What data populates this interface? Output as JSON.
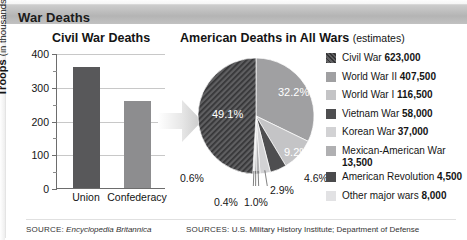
{
  "header": {
    "title": "War Deaths"
  },
  "bar_chart": {
    "title": "Civil War Deaths",
    "axis_label_main": "Troops",
    "axis_label_sub": "(in thousands)",
    "source_lead": "SOURCE:",
    "source_text": "Encyclopedia Britannica"
  },
  "pie_chart": {
    "title": "American Deaths in All Wars",
    "title_note": "(estimates)",
    "source_lead": "SOURCES:",
    "source_text": "U.S. Military History Institute; Department of Defense"
  },
  "chart_data": [
    {
      "type": "bar",
      "title": "Civil War Deaths",
      "categories": [
        "Union",
        "Confederacy"
      ],
      "values": [
        360,
        258
      ],
      "colors": [
        "#58585a",
        "#8d8d8f"
      ],
      "xlabel": "",
      "ylabel": "Troops (in thousands)",
      "ylim": [
        0,
        400
      ],
      "yticks": [
        0,
        100,
        200,
        300,
        400
      ],
      "ytick_labels": [
        "0",
        "100",
        "200",
        "300",
        "400"
      ],
      "grid": true
    },
    {
      "type": "pie",
      "title": "American Deaths in All Wars (estimates)",
      "labels": [
        "Civil War",
        "World War II",
        "World War I",
        "Vietnam War",
        "Korean War",
        "Mexican-American War",
        "American Revolution",
        "Other major wars"
      ],
      "values": [
        623000,
        407500,
        116500,
        58000,
        37000,
        13500,
        4500,
        8000
      ],
      "value_labels": [
        "623,000",
        "407,500",
        "116,500",
        "58,000",
        "37,000",
        "13,500",
        "4,500",
        "8,000"
      ],
      "percents": [
        "49.1%",
        "32.2%",
        "9.2%",
        "4.6%",
        "2.9%",
        "1.0%",
        "0.4%",
        "0.6%"
      ],
      "percent_values": [
        49.1,
        32.2,
        9.2,
        4.6,
        2.9,
        1.0,
        0.4,
        0.6
      ],
      "colors": [
        "#5f5f61",
        "#a0a0a2",
        "#c4c4c6",
        "#4e4e50",
        "#d2d2d4",
        "#b0b0b2",
        "#4a4a4c",
        "#e2e2e4"
      ],
      "hatched_index": 0,
      "legend": "right",
      "start_angle": 0,
      "direction": "clockwise"
    }
  ]
}
